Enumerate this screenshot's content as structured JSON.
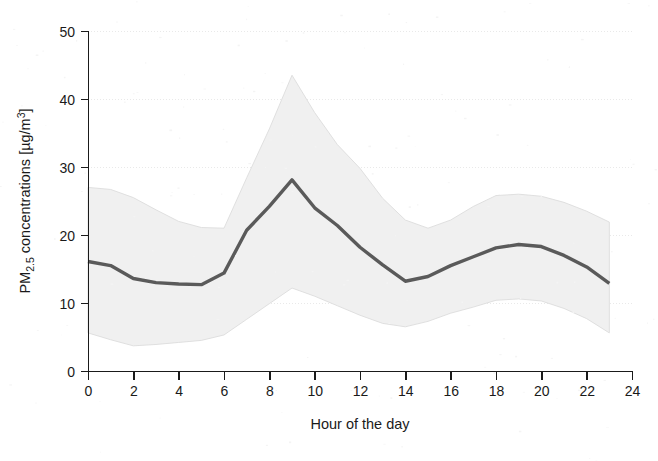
{
  "figure": {
    "background_color": "#ffffff",
    "plot_area": {
      "left": 88,
      "top": 31,
      "right": 632,
      "bottom": 371
    }
  },
  "chart_data": {
    "type": "line",
    "title": "",
    "subtitle": "",
    "xlabel": "Hour of the day",
    "ylabel": "PM2.5 concentrations [µg/m³]",
    "ylabel_parts": {
      "prefix": "PM",
      "subscript": "2.5",
      "middle": " concentrations [µg/m",
      "superscript": "3",
      "suffix": "]"
    },
    "x": [
      0,
      1,
      2,
      3,
      4,
      5,
      6,
      7,
      8,
      9,
      10,
      11,
      12,
      13,
      14,
      15,
      16,
      17,
      18,
      19,
      20,
      21,
      22,
      23
    ],
    "xlim": [
      0,
      24
    ],
    "ylim": [
      0,
      50
    ],
    "xticks": [
      0,
      2,
      4,
      6,
      8,
      10,
      12,
      14,
      16,
      18,
      20,
      22,
      24
    ],
    "xtick_labels": [
      "0",
      "2",
      "4",
      "6",
      "8",
      "10",
      "12",
      "14",
      "16",
      "18",
      "20",
      "22",
      "24"
    ],
    "yticks": [
      0,
      10,
      20,
      30,
      40,
      50
    ],
    "ytick_labels": [
      "0",
      "10",
      "20",
      "30",
      "40",
      "50"
    ],
    "grid": "horizontal-dotted-light",
    "legend": "none",
    "legend_position": "none",
    "series": [
      {
        "name": "Mean PM2.5 concentration",
        "role": "central-line",
        "color": "#5a5a5a",
        "values": [
          16.1,
          15.5,
          13.6,
          13.0,
          12.8,
          12.7,
          14.4,
          20.7,
          24.2,
          28.1,
          24.0,
          21.4,
          18.2,
          15.6,
          13.2,
          13.9,
          15.5,
          16.8,
          18.1,
          18.6,
          18.3,
          17.0,
          15.3,
          12.9
        ]
      },
      {
        "name": "Upper bound (variability band)",
        "role": "band-upper",
        "color": "#f0f0f0",
        "values": [
          27.0,
          26.7,
          25.5,
          23.7,
          22.0,
          21.1,
          21.0,
          28.4,
          35.6,
          43.5,
          38.0,
          33.3,
          29.8,
          25.4,
          22.2,
          21.0,
          22.2,
          24.2,
          25.8,
          26.0,
          25.7,
          24.8,
          23.5,
          21.9
        ]
      },
      {
        "name": "Lower bound (variability band)",
        "role": "band-lower",
        "color": "#f0f0f0",
        "values": [
          5.6,
          4.6,
          3.7,
          3.9,
          4.2,
          4.5,
          5.3,
          7.6,
          9.9,
          12.2,
          11.0,
          9.6,
          8.2,
          7.0,
          6.5,
          7.3,
          8.5,
          9.4,
          10.4,
          10.6,
          10.3,
          9.2,
          7.7,
          5.6
        ]
      }
    ],
    "annotations": []
  }
}
